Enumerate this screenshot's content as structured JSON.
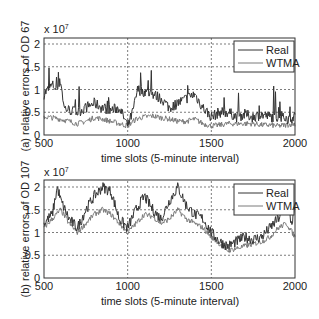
{
  "chart_data": [
    {
      "type": "line",
      "title": "",
      "xlabel": "time slots (5-minute interval)",
      "ylabel": "(a) relative errors of OD 67",
      "y_multiplier": "x 10^7",
      "xlim": [
        500,
        2000
      ],
      "ylim": [
        0,
        2.2
      ],
      "xticks": [
        500,
        1000,
        1500,
        2000
      ],
      "yticks": [
        0,
        0.5,
        1,
        1.5,
        2
      ],
      "grid": true,
      "legend_position": "upper right",
      "series": [
        {
          "name": "Real",
          "color": "#333333",
          "x": [
            500,
            550,
            580,
            600,
            620,
            650,
            700,
            750,
            800,
            850,
            900,
            950,
            1000,
            1030,
            1060,
            1100,
            1150,
            1200,
            1250,
            1300,
            1350,
            1400,
            1450,
            1500,
            1550,
            1600,
            1650,
            1700,
            1750,
            1800,
            1850,
            1900,
            1950,
            2000
          ],
          "values": [
            0.9,
            1.1,
            1.0,
            1.2,
            0.6,
            0.55,
            0.5,
            0.6,
            0.7,
            0.6,
            0.55,
            0.6,
            0.2,
            0.5,
            1.0,
            0.95,
            0.9,
            0.8,
            0.6,
            0.7,
            0.8,
            0.9,
            0.6,
            0.4,
            0.5,
            0.5,
            0.4,
            0.45,
            0.4,
            0.45,
            0.4,
            0.4,
            0.35,
            0.4
          ]
        },
        {
          "name": "WTMA",
          "color": "#777777",
          "x": [
            500,
            550,
            600,
            650,
            700,
            750,
            800,
            850,
            900,
            950,
            1000,
            1050,
            1100,
            1150,
            1200,
            1250,
            1300,
            1350,
            1400,
            1450,
            1500,
            1550,
            1600,
            1650,
            1700,
            1750,
            1800,
            1850,
            1900,
            1950,
            2000
          ],
          "values": [
            0.4,
            0.38,
            0.35,
            0.3,
            0.25,
            0.3,
            0.38,
            0.35,
            0.3,
            0.25,
            0.2,
            0.35,
            0.4,
            0.42,
            0.38,
            0.35,
            0.3,
            0.3,
            0.35,
            0.25,
            0.2,
            0.22,
            0.25,
            0.25,
            0.25,
            0.25,
            0.22,
            0.22,
            0.2,
            0.22,
            0.25
          ]
        }
      ]
    },
    {
      "type": "line",
      "title": "",
      "xlabel": "time slots (5-minute interval)",
      "ylabel": "(b) relative errors of OD 107",
      "y_multiplier": "x 10^7",
      "xlim": [
        500,
        2000
      ],
      "ylim": [
        0,
        2.2
      ],
      "xticks": [
        500,
        1000,
        1500,
        2000
      ],
      "yticks": [
        0,
        0.5,
        1,
        1.5,
        2
      ],
      "grid": true,
      "legend_position": "upper right",
      "series": [
        {
          "name": "Real",
          "color": "#333333",
          "x": [
            500,
            550,
            580,
            600,
            650,
            700,
            750,
            800,
            850,
            900,
            950,
            1000,
            1050,
            1100,
            1150,
            1200,
            1250,
            1300,
            1350,
            1400,
            1450,
            1500,
            1550,
            1600,
            1650,
            1700,
            1750,
            1800,
            1850,
            1900,
            1950,
            1980,
            2000
          ],
          "values": [
            1.2,
            1.4,
            2.0,
            1.7,
            1.3,
            1.1,
            1.5,
            1.8,
            2.0,
            1.9,
            1.3,
            1.1,
            1.5,
            1.8,
            1.5,
            1.3,
            1.7,
            2.0,
            1.6,
            1.4,
            1.3,
            1.0,
            0.8,
            0.7,
            0.8,
            0.9,
            0.85,
            0.9,
            1.1,
            1.3,
            1.6,
            1.2,
            1.5
          ]
        },
        {
          "name": "WTMA",
          "color": "#777777",
          "x": [
            500,
            550,
            600,
            650,
            700,
            750,
            800,
            850,
            900,
            950,
            1000,
            1050,
            1100,
            1150,
            1200,
            1250,
            1300,
            1350,
            1400,
            1450,
            1500,
            1550,
            1600,
            1650,
            1700,
            1750,
            1800,
            1850,
            1900,
            1950,
            2000
          ],
          "values": [
            1.1,
            1.3,
            1.5,
            1.2,
            1.0,
            1.2,
            1.4,
            1.5,
            1.4,
            1.2,
            1.0,
            1.2,
            1.4,
            1.35,
            1.2,
            1.3,
            1.5,
            1.3,
            1.2,
            1.1,
            0.9,
            0.75,
            0.6,
            0.65,
            0.7,
            0.75,
            0.8,
            0.9,
            1.1,
            1.2,
            0.9
          ]
        }
      ]
    }
  ],
  "panels": {
    "a": {
      "multiplier_base": "x 10",
      "multiplier_exp": "7",
      "ylabel": "(a) relative errors of OD 67",
      "xlabel": "time slots (5-minute interval)",
      "legend": [
        "Real",
        "WTMA"
      ]
    },
    "b": {
      "multiplier_base": "x 10",
      "multiplier_exp": "7",
      "ylabel": "(b) relative errors of OD 107",
      "xlabel": "time slots (5-minute interval)",
      "legend": [
        "Real",
        "WTMA"
      ]
    }
  },
  "ticks": {
    "x": [
      "500",
      "1000",
      "1500",
      "2000"
    ],
    "y": [
      "0",
      "0.5",
      "1",
      "1.5",
      "2"
    ]
  }
}
